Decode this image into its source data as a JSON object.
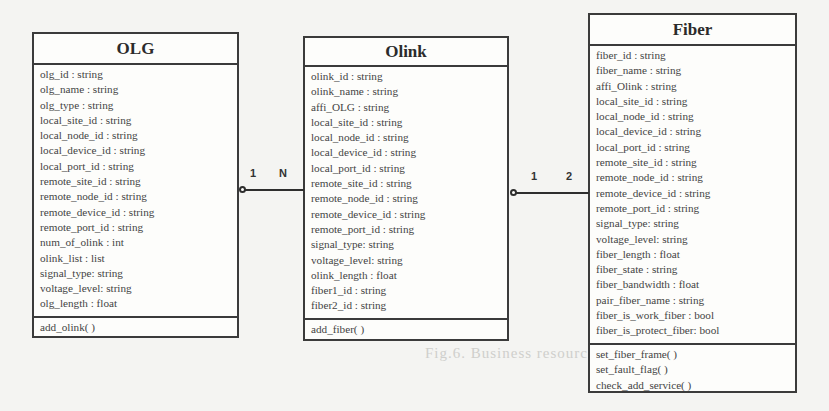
{
  "diagram": {
    "type": "UML class diagram",
    "caption_ghost": "Fig.6.  Business resource model"
  },
  "classes": {
    "olg": {
      "name": "OLG",
      "attributes": [
        "olg_id : string",
        "olg_name : string",
        "olg_type : string",
        "local_site_id : string",
        "local_node_id : string",
        "local_device_id : string",
        "local_port_id : string",
        "remote_site_id : string",
        "remote_node_id : string",
        "remote_device_id : string",
        "remote_port_id : string",
        "num_of_olink : int",
        "olink_list : list",
        "signal_type: string",
        "voltage_level: string",
        "olg_length : float"
      ],
      "methods": [
        "add_olink( )"
      ]
    },
    "olink": {
      "name": "Olink",
      "attributes": [
        "olink_id : string",
        "olink_name : string",
        "affi_OLG : string",
        "local_site_id : string",
        "local_node_id : string",
        "local_device_id : string",
        "local_port_id : string",
        "remote_site_id : string",
        "remote_node_id : string",
        "remote_device_id : string",
        "remote_port_id : string",
        "signal_type: string",
        "voltage_level: string",
        "olink_length : float",
        "fiber1_id : string",
        "fiber2_id : string"
      ],
      "methods": [
        "add_fiber( )"
      ]
    },
    "fiber": {
      "name": "Fiber",
      "attributes": [
        "fiber_id : string",
        "fiber_name : string",
        "affi_Olink : string",
        "local_site_id : string",
        "local_node_id : string",
        "local_device_id : string",
        "local_port_id : string",
        "remote_site_id : string",
        "remote_node_id : string",
        "remote_device_id : string",
        "remote_port_id : string",
        "signal_type: string",
        "voltage_level: string",
        "fiber_length : float",
        "fiber_state : string",
        "fiber_bandwidth : float",
        "pair_fiber_name : string",
        "fiber_is_work_fiber : bool",
        "fiber_is_protect_fiber: bool"
      ],
      "methods": [
        "set_fiber_frame( )",
        "set_fault_flag( )",
        "check_add_service( )"
      ]
    }
  },
  "associations": [
    {
      "from": "OLG",
      "to": "Olink",
      "kind": "aggregation",
      "source_multiplicity": "1",
      "target_multiplicity": "N"
    },
    {
      "from": "Olink",
      "to": "Fiber",
      "kind": "aggregation",
      "source_multiplicity": "1",
      "target_multiplicity": "2"
    }
  ]
}
